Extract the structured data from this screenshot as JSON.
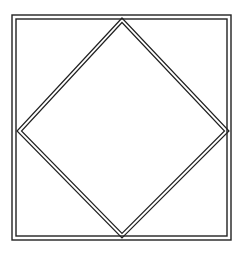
{
  "diagram": {
    "stroke_color": "#222222",
    "background_color": "#ffffff",
    "outer_square": {
      "x": 12,
      "y": 15,
      "width": 218,
      "height": 224,
      "line_style": "double",
      "gap": 4
    },
    "inner_diamond": {
      "vertices": {
        "top": [
          122,
          18
        ],
        "right": [
          228,
          131
        ],
        "bottom": [
          122,
          236
        ],
        "left": [
          18,
          131
        ]
      },
      "line_style": "double",
      "gap": 3
    }
  }
}
